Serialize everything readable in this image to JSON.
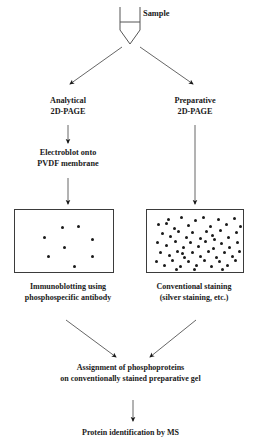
{
  "diagram": {
    "nodes": {
      "sample": {
        "label": "Sample"
      },
      "analytical": {
        "line1": "Analytical",
        "line2": "2D-PAGE"
      },
      "preparative": {
        "line1": "Preparative",
        "line2": "2D-PAGE"
      },
      "electroblot": {
        "line1": "Electroblot onto",
        "line2": "PVDF membrane"
      },
      "immunoblotting": {
        "line1": "Immunoblotting using",
        "line2": "phosphospecific antibody"
      },
      "conventional": {
        "line1": "Conventional staining",
        "line2": "(silver staining, etc.)"
      },
      "assignment": {
        "line1": "Assignment of phosphoproteins",
        "line2": "on conventionally stained preparative gel"
      },
      "ms": {
        "line1": "Protein identification by MS"
      }
    },
    "colors": {
      "ink": "#1a1a1a",
      "line": "#555555",
      "box_border": "#3b3b3b",
      "background": "#ffffff",
      "spot": "#1a1a1a"
    },
    "gels": {
      "analytical": {
        "caption": "sparse phosphoprotein spots",
        "spot_count": 8,
        "spots": [
          [
            28,
            26
          ],
          [
            46,
            16
          ],
          [
            62,
            15
          ],
          [
            76,
            28
          ],
          [
            48,
            36
          ],
          [
            32,
            45
          ],
          [
            76,
            45
          ],
          [
            58,
            55
          ]
        ]
      },
      "preparative": {
        "caption": "dense total protein spots",
        "spot_count": 62,
        "spots": [
          [
            10,
            13
          ],
          [
            20,
            8
          ],
          [
            26,
            17
          ],
          [
            33,
            6
          ],
          [
            40,
            14
          ],
          [
            47,
            9
          ],
          [
            55,
            6
          ],
          [
            62,
            15
          ],
          [
            70,
            8
          ],
          [
            78,
            13
          ],
          [
            86,
            7
          ],
          [
            14,
            22
          ],
          [
            22,
            25
          ],
          [
            30,
            20
          ],
          [
            38,
            26
          ],
          [
            44,
            21
          ],
          [
            52,
            27
          ],
          [
            58,
            20
          ],
          [
            64,
            24
          ],
          [
            72,
            19
          ],
          [
            80,
            26
          ],
          [
            88,
            21
          ],
          [
            9,
            31
          ],
          [
            18,
            34
          ],
          [
            27,
            30
          ],
          [
            35,
            36
          ],
          [
            42,
            31
          ],
          [
            50,
            35
          ],
          [
            57,
            30
          ],
          [
            65,
            37
          ],
          [
            73,
            32
          ],
          [
            81,
            36
          ],
          [
            89,
            31
          ],
          [
            12,
            41
          ],
          [
            21,
            44
          ],
          [
            29,
            40
          ],
          [
            36,
            46
          ],
          [
            44,
            41
          ],
          [
            52,
            45
          ],
          [
            60,
            40
          ],
          [
            68,
            46
          ],
          [
            76,
            41
          ],
          [
            84,
            45
          ],
          [
            91,
            40
          ],
          [
            8,
            50
          ],
          [
            16,
            54
          ],
          [
            24,
            49
          ],
          [
            32,
            55
          ],
          [
            40,
            50
          ],
          [
            48,
            54
          ],
          [
            56,
            49
          ],
          [
            63,
            55
          ],
          [
            71,
            50
          ],
          [
            79,
            54
          ],
          [
            87,
            49
          ],
          [
            18,
            12
          ],
          [
            34,
            42
          ],
          [
            66,
            28
          ],
          [
            46,
            58
          ],
          [
            74,
            58
          ],
          [
            28,
            58
          ],
          [
            92,
            15
          ]
        ]
      }
    },
    "connectors": [
      {
        "name": "sample-to-analytical",
        "type": "diagonal-arrow"
      },
      {
        "name": "sample-to-preparative",
        "type": "diagonal-arrow"
      },
      {
        "name": "analytical-to-electroblot",
        "type": "vertical-arrow"
      },
      {
        "name": "electroblot-to-gel",
        "type": "vertical-arrow"
      },
      {
        "name": "preparative-to-gel",
        "type": "vertical-arrow"
      },
      {
        "name": "immunoblotting-to-assignment",
        "type": "diagonal-arrow"
      },
      {
        "name": "conventional-to-assignment",
        "type": "diagonal-arrow"
      },
      {
        "name": "assignment-to-ms",
        "type": "vertical-arrow"
      }
    ]
  }
}
